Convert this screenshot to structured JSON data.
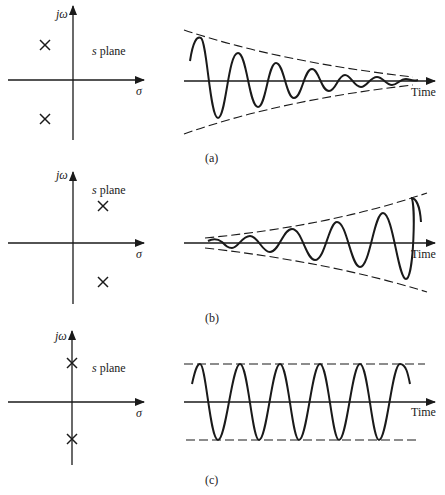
{
  "figure": {
    "panels": [
      {
        "id": "a",
        "caption": "(a)",
        "s_plane": {
          "title": "s plane",
          "title_s": "s",
          "title_rest": " plane",
          "y_axis_label": "jω",
          "x_axis_label": "σ",
          "poles": [
            {
              "x": 45,
              "y": 45
            },
            {
              "x": 45,
              "y": 119
            }
          ],
          "pole_location": "left half-plane"
        },
        "response": {
          "x_axis_label": "Time",
          "behavior": "decaying oscillation"
        }
      },
      {
        "id": "b",
        "caption": "(b)",
        "s_plane": {
          "title": "s plane",
          "title_s": "s",
          "title_rest": " plane",
          "y_axis_label": "jω",
          "x_axis_label": "σ",
          "poles": [
            {
              "x": 103,
              "y": 206
            },
            {
              "x": 103,
              "y": 282
            }
          ],
          "pole_location": "right half-plane"
        },
        "response": {
          "x_axis_label": "Time",
          "behavior": "growing oscillation"
        }
      },
      {
        "id": "c",
        "caption": "(c)",
        "s_plane": {
          "title": "s plane",
          "title_s": "s",
          "title_rest": " plane",
          "y_axis_label": "jω",
          "x_axis_label": "σ",
          "poles": [
            {
              "x": 72,
              "y": 363
            },
            {
              "x": 72,
              "y": 439
            }
          ],
          "pole_location": "imaginary axis"
        },
        "response": {
          "x_axis_label": "Time",
          "behavior": "sustained oscillation"
        }
      }
    ],
    "colors": {
      "ink": "#1a1a1a",
      "background": "#ffffff"
    }
  }
}
